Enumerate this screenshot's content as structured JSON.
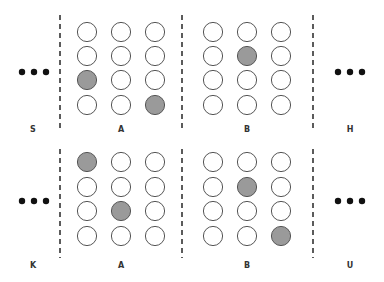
{
  "colors": {
    "empty_fill": "#ffffff",
    "filled_fill": "#9a9a9a",
    "stroke": "#555555",
    "dash": "#333333",
    "dot": "#111111"
  },
  "panels": [
    {
      "name": "top",
      "left_label": "S",
      "right_label": "H",
      "groups": [
        {
          "label": "A",
          "filled": [
            [
              2,
              0
            ],
            [
              3,
              2
            ]
          ]
        },
        {
          "label": "B",
          "filled": [
            [
              1,
              1
            ]
          ]
        }
      ]
    },
    {
      "name": "bottom",
      "left_label": "K",
      "right_label": "U",
      "groups": [
        {
          "label": "A",
          "filled": [
            [
              0,
              0
            ],
            [
              2,
              1
            ]
          ]
        },
        {
          "label": "B",
          "filled": [
            [
              1,
              1
            ],
            [
              3,
              2
            ]
          ]
        }
      ]
    }
  ],
  "grid": {
    "rows": 4,
    "cols": 3
  },
  "ellipsis": "•••"
}
